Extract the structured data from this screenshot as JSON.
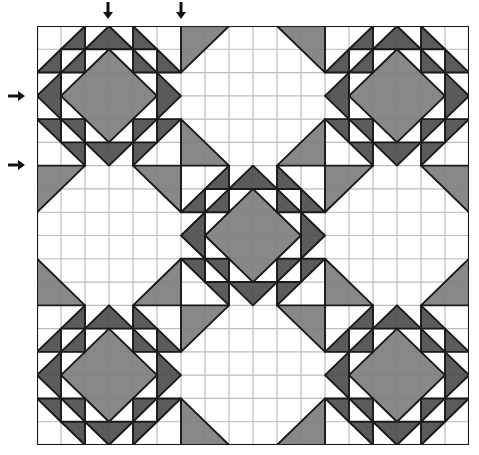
{
  "diagram": {
    "type": "quilt-layout",
    "grid": {
      "cols": 18,
      "rows": 18,
      "block_size_cells": 6,
      "blocks_per_side": 3
    },
    "colors": {
      "background": "#ffffff",
      "grid_line": "#bdbdbd",
      "outline": "#1a1a1a",
      "dark": "#4d4d4d",
      "medium": "#7e7e7e"
    },
    "block_layout": [
      [
        "star",
        "snowball",
        "star"
      ],
      [
        "snowball",
        "star",
        "snowball"
      ],
      [
        "star",
        "snowball",
        "star"
      ]
    ],
    "blocks": {
      "star": {
        "center_diamond": {
          "color": "medium",
          "points": [
            [
              3,
              1
            ],
            [
              5,
              3
            ],
            [
              3,
              5
            ],
            [
              1,
              3
            ]
          ]
        },
        "flying_geese": {
          "color": "dark",
          "pieces": [
            [
              [
                2,
                1
              ],
              [
                3,
                0
              ],
              [
                4,
                1
              ]
            ],
            [
              [
                2,
                5
              ],
              [
                3,
                6
              ],
              [
                4,
                5
              ]
            ],
            [
              [
                1,
                2
              ],
              [
                0,
                3
              ],
              [
                1,
                4
              ]
            ],
            [
              [
                5,
                2
              ],
              [
                6,
                3
              ],
              [
                5,
                4
              ]
            ]
          ]
        },
        "corner_triangles": {
          "color": "dark",
          "pieces": [
            [
              [
                0,
                2
              ],
              [
                1,
                1
              ],
              [
                1,
                2
              ]
            ],
            [
              [
                1,
                1
              ],
              [
                2,
                0
              ],
              [
                2,
                1
              ]
            ],
            [
              [
                1,
                2
              ],
              [
                2,
                1
              ],
              [
                2,
                2
              ]
            ],
            [
              [
                5,
                1
              ],
              [
                6,
                2
              ],
              [
                5,
                2
              ]
            ],
            [
              [
                4,
                0
              ],
              [
                5,
                1
              ],
              [
                4,
                1
              ]
            ],
            [
              [
                4,
                1
              ],
              [
                5,
                2
              ],
              [
                4,
                2
              ]
            ],
            [
              [
                0,
                4
              ],
              [
                1,
                4
              ],
              [
                1,
                5
              ]
            ],
            [
              [
                1,
                5
              ],
              [
                2,
                5
              ],
              [
                2,
                6
              ]
            ],
            [
              [
                1,
                4
              ],
              [
                2,
                4
              ],
              [
                2,
                5
              ]
            ],
            [
              [
                5,
                4
              ],
              [
                6,
                4
              ],
              [
                5,
                5
              ]
            ],
            [
              [
                4,
                5
              ],
              [
                5,
                5
              ],
              [
                4,
                6
              ]
            ],
            [
              [
                4,
                4
              ],
              [
                5,
                4
              ],
              [
                4,
                5
              ]
            ]
          ]
        }
      },
      "snowball": {
        "corners": {
          "color": "medium",
          "pieces": [
            [
              [
                0,
                0
              ],
              [
                2,
                0
              ],
              [
                0,
                2
              ]
            ],
            [
              [
                4,
                0
              ],
              [
                6,
                0
              ],
              [
                6,
                2
              ]
            ],
            [
              [
                0,
                4
              ],
              [
                0,
                6
              ],
              [
                2,
                6
              ]
            ],
            [
              [
                6,
                4
              ],
              [
                6,
                6
              ],
              [
                4,
                6
              ]
            ]
          ]
        }
      }
    },
    "arrows": {
      "top": [
        {
          "label": "column-arrow-1",
          "x": 108,
          "y": 3,
          "direction": "down"
        },
        {
          "label": "column-arrow-2",
          "x": 181,
          "y": 3,
          "direction": "down"
        }
      ],
      "left": [
        {
          "label": "row-arrow-1",
          "x": 8,
          "y": 96,
          "direction": "right"
        },
        {
          "label": "row-arrow-2",
          "x": 8,
          "y": 165,
          "direction": "right"
        }
      ]
    }
  }
}
